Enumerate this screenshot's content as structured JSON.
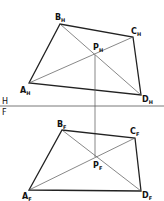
{
  "diagram": {
    "type": "descriptive-geometry-projection",
    "fold_line": {
      "upper_label": "H",
      "lower_label": "F",
      "y": 106
    },
    "views": [
      {
        "name": "horizontal",
        "subscript": "H",
        "vertices": [
          {
            "name": "A",
            "sub": "H",
            "x": 29,
            "y": 83
          },
          {
            "name": "B",
            "sub": "H",
            "x": 60,
            "y": 24
          },
          {
            "name": "C",
            "sub": "H",
            "x": 133,
            "y": 37
          },
          {
            "name": "D",
            "sub": "H",
            "x": 141,
            "y": 95
          }
        ],
        "intersection": {
          "name": "P",
          "sub": "H",
          "x": 95,
          "y": 55
        }
      },
      {
        "name": "frontal",
        "subscript": "F",
        "vertices": [
          {
            "name": "A",
            "sub": "F",
            "x": 29,
            "y": 190
          },
          {
            "name": "B",
            "sub": "F",
            "x": 62,
            "y": 130
          },
          {
            "name": "C",
            "sub": "F",
            "x": 135,
            "y": 138
          },
          {
            "name": "D",
            "sub": "F",
            "x": 141,
            "y": 191
          }
        ],
        "intersection": {
          "name": "P",
          "sub": "F",
          "x": 95,
          "y": 157
        }
      }
    ],
    "projector": {
      "x": 95,
      "from_y": 55,
      "to_y": 157
    },
    "colors": {
      "stroke": "#222222",
      "thin_stroke": "#555555",
      "background": "#ffffff"
    }
  }
}
